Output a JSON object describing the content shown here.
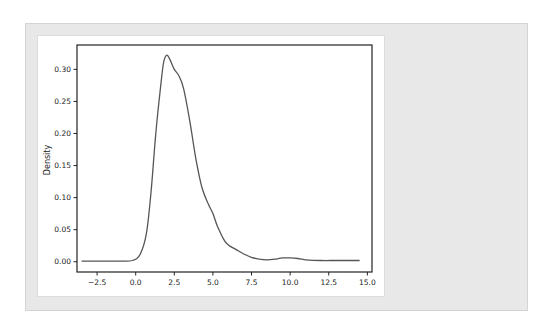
{
  "chart_data": {
    "type": "line",
    "title": "",
    "xlabel": "",
    "ylabel": "Density",
    "xlim": [
      -3.8,
      15.3
    ],
    "ylim": [
      -0.016,
      0.338
    ],
    "xticks": [
      "-2.5",
      "0.0",
      "2.5",
      "5.0",
      "7.5",
      "10.0",
      "12.5",
      "15.0"
    ],
    "yticks": [
      "0.00",
      "0.05",
      "0.10",
      "0.15",
      "0.20",
      "0.25",
      "0.30"
    ],
    "grid": false,
    "legend": null,
    "series": [
      {
        "name": "density",
        "color": "#555555",
        "x": [
          -3.5,
          -2.0,
          -1.0,
          -0.2,
          0.3,
          0.7,
          1.0,
          1.3,
          1.6,
          1.8,
          2.0,
          2.2,
          2.5,
          2.8,
          3.1,
          3.5,
          3.9,
          4.3,
          4.7,
          5.0,
          5.3,
          5.7,
          6.0,
          6.5,
          7.0,
          7.5,
          8.0,
          8.5,
          9.0,
          9.5,
          10.0,
          10.5,
          11.0,
          12.0,
          13.0,
          14.5
        ],
        "y": [
          0.001,
          0.001,
          0.001,
          0.002,
          0.012,
          0.045,
          0.11,
          0.2,
          0.27,
          0.31,
          0.322,
          0.316,
          0.3,
          0.29,
          0.27,
          0.22,
          0.16,
          0.115,
          0.09,
          0.075,
          0.055,
          0.035,
          0.026,
          0.019,
          0.012,
          0.007,
          0.004,
          0.003,
          0.004,
          0.006,
          0.006,
          0.005,
          0.003,
          0.002,
          0.002,
          0.002
        ]
      }
    ]
  },
  "frame": {
    "outer_bg": "#e8e8e8",
    "panel_bg": "#ffffff",
    "axes_color": "#222222",
    "line_color": "#555555"
  }
}
